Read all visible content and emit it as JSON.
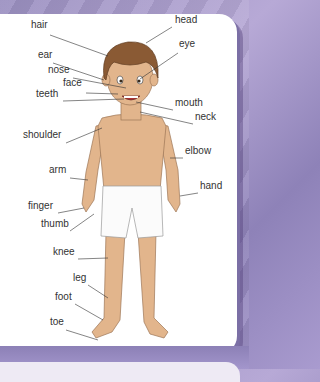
{
  "diagram": {
    "labels": [
      {
        "key": "hair",
        "text": "hair",
        "x": 31,
        "y": 28
      },
      {
        "key": "head",
        "text": "head",
        "x": 175,
        "y": 23
      },
      {
        "key": "eye",
        "text": "eye",
        "x": 179,
        "y": 47
      },
      {
        "key": "ear",
        "text": "ear",
        "x": 38,
        "y": 58
      },
      {
        "key": "nose",
        "text": "nose",
        "x": 48,
        "y": 73
      },
      {
        "key": "face",
        "text": "face",
        "x": 63,
        "y": 86
      },
      {
        "key": "teeth",
        "text": "teeth",
        "x": 36,
        "y": 97
      },
      {
        "key": "mouth",
        "text": "mouth",
        "x": 175,
        "y": 106
      },
      {
        "key": "neck",
        "text": "neck",
        "x": 195,
        "y": 120
      },
      {
        "key": "shoulder",
        "text": "shoulder",
        "x": 23,
        "y": 138
      },
      {
        "key": "elbow",
        "text": "elbow",
        "x": 185,
        "y": 154
      },
      {
        "key": "arm",
        "text": "arm",
        "x": 49,
        "y": 173
      },
      {
        "key": "hand",
        "text": "hand",
        "x": 200,
        "y": 189
      },
      {
        "key": "finger",
        "text": "finger",
        "x": 28,
        "y": 209
      },
      {
        "key": "thumb",
        "text": "thumb",
        "x": 41,
        "y": 227
      },
      {
        "key": "knee",
        "text": "knee",
        "x": 53,
        "y": 255
      },
      {
        "key": "leg",
        "text": "leg",
        "x": 73,
        "y": 281
      },
      {
        "key": "foot",
        "text": "foot",
        "x": 55,
        "y": 300
      },
      {
        "key": "toe",
        "text": "toe",
        "x": 50,
        "y": 325
      }
    ]
  },
  "colors": {
    "background": "#a99bcf",
    "card": "#ffffff",
    "skin": "#e2b58c",
    "hair": "#8a5a34",
    "shorts": "#ffffff"
  }
}
